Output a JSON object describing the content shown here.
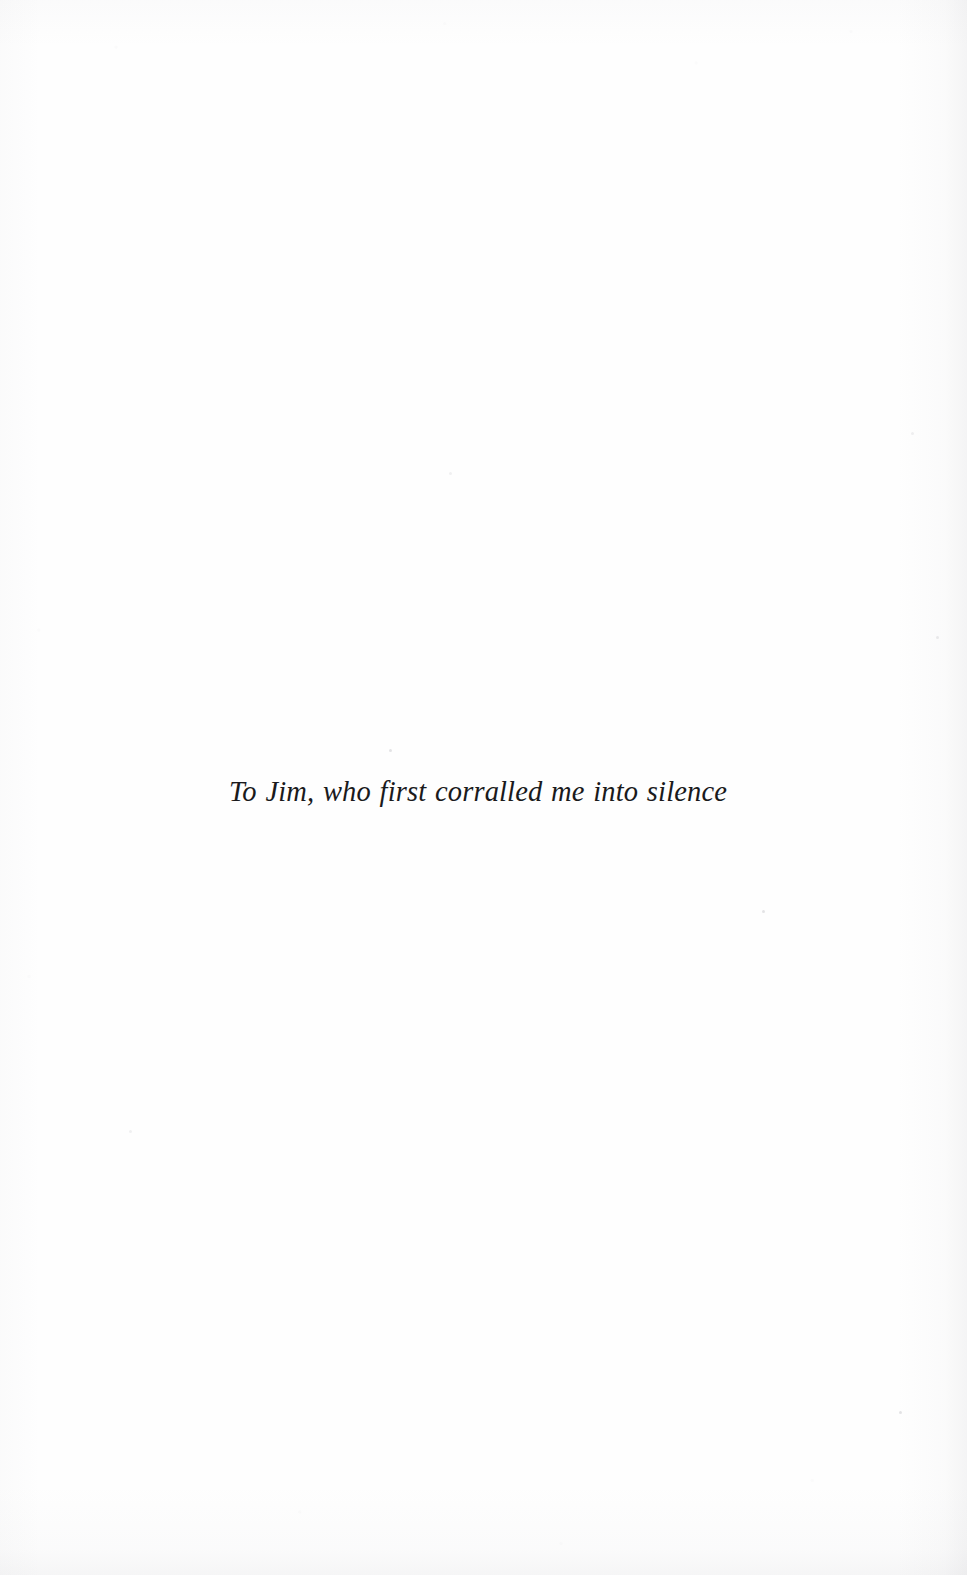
{
  "page": {
    "kind": "book-dedication-page",
    "width": 967,
    "height": 1575,
    "background_color": "#fefefe",
    "text_color": "#1a1a1c"
  },
  "dedication": {
    "text": "To Jim, who first corralled me into silence",
    "style": "italic-serif",
    "alignment": "center",
    "font_size_px": 28.5,
    "baseline_y": 807,
    "span_x": [
      228,
      717
    ]
  },
  "artifacts": {
    "specks": [
      {
        "x": 389,
        "y": 749
      },
      {
        "x": 762,
        "y": 910
      },
      {
        "x": 899,
        "y": 1411
      },
      {
        "x": 936,
        "y": 636
      },
      {
        "x": 911,
        "y": 432
      },
      {
        "x": 449,
        "y": 472
      },
      {
        "x": 129,
        "y": 1130
      }
    ],
    "edge_shading": "right-and-bottom"
  }
}
